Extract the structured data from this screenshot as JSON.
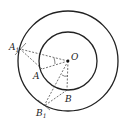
{
  "diagram": {
    "type": "geometry",
    "center": {
      "label": "O",
      "x": 68,
      "y": 61
    },
    "circles": [
      {
        "name": "outer",
        "r": 50
      },
      {
        "name": "inner",
        "r": 29
      }
    ],
    "points": {
      "A1": {
        "label": "A",
        "sub": "1",
        "x": 20,
        "y": 49
      },
      "A": {
        "label": "A",
        "x": 42,
        "y": 69
      },
      "B": {
        "label": "B",
        "x": 67,
        "y": 90
      },
      "B1": {
        "label": "B",
        "sub": "1",
        "x": 44,
        "y": 106
      }
    },
    "labels": {
      "O": "O",
      "A": "A",
      "A1": "A",
      "A1_sub": "1",
      "B": "B",
      "B1": "B",
      "B1_sub": "1"
    }
  }
}
